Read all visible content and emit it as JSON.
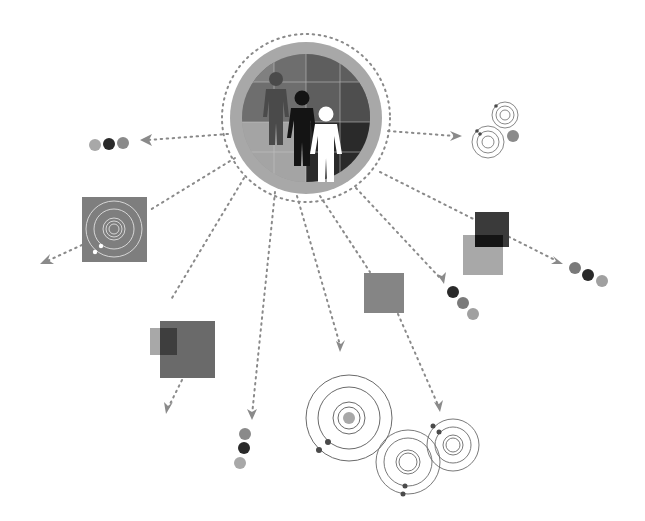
{
  "diagram": {
    "title": "",
    "colors": {
      "background": "#ffffff",
      "arrow": "#8a8a8a",
      "light_gray": "#a8a8a8",
      "mid_gray": "#7a7a7a",
      "dark_gray": "#5a5a5a",
      "black": "#1e1e1e",
      "ring_outer": "#b0b0b0",
      "orbit_line": "#6a6a6a"
    },
    "hub": {
      "name": "people-emblem",
      "cx": 306,
      "cy": 118,
      "r": 76,
      "figures": [
        "dark-gray-person",
        "black-person",
        "white-person"
      ]
    },
    "nodes": [
      {
        "id": "dots-left",
        "type": "dot-trio",
        "x": 108,
        "y": 145
      },
      {
        "id": "orbit-square-left",
        "type": "orbit-square",
        "x": 82,
        "y": 197
      },
      {
        "id": "squares-lower-left",
        "type": "overlap-squares",
        "x": 150,
        "y": 321
      },
      {
        "id": "dots-bottom-left",
        "type": "dot-trio-vertical",
        "x": 240,
        "y": 446
      },
      {
        "id": "orbit-large-bottom",
        "type": "orbit-rings",
        "x": 350,
        "y": 418
      },
      {
        "id": "square-middle",
        "type": "single-square",
        "x": 364,
        "y": 273
      },
      {
        "id": "orbit-pair-bottom-right",
        "type": "orbit-rings-pair",
        "x": 430,
        "y": 460
      },
      {
        "id": "dots-right-lower",
        "type": "dot-trio-diagonal",
        "x": 455,
        "y": 300
      },
      {
        "id": "squares-right",
        "type": "overlap-squares",
        "x": 474,
        "y": 212
      },
      {
        "id": "dots-far-right",
        "type": "dot-trio-diagonal",
        "x": 588,
        "y": 272
      },
      {
        "id": "orbit-pair-top-right",
        "type": "orbit-rings-pair",
        "x": 500,
        "y": 130
      }
    ]
  }
}
